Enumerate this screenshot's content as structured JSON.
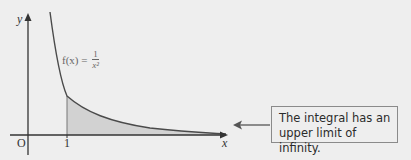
{
  "diagram": {
    "function_label": {
      "prefix": "f(x) = ",
      "numerator": "1",
      "denominator": "x²"
    },
    "axes": {
      "x_label": "x",
      "y_label": "y",
      "origin_label": "O",
      "tick_labels": [
        "1"
      ]
    },
    "shaded_region": {
      "from": 1,
      "to": "infinity"
    },
    "callout": {
      "line1": "The integral has an",
      "line2": "upper limit of infinity."
    },
    "colors": {
      "background": "#eeeeee",
      "curve": "#4a4a4a",
      "shade": "#d2d2d2",
      "axis": "#333333"
    }
  }
}
